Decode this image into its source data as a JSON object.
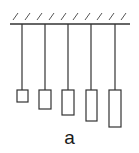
{
  "figure": {
    "label": "a",
    "ceiling": {
      "x1": 10,
      "x2": 130,
      "y": 24,
      "hatch_count": 10
    },
    "pendulums": [
      {
        "string_x": 22,
        "box_x": 17,
        "box_y": 90,
        "box_w": 11,
        "box_h": 12
      },
      {
        "string_x": 45,
        "box_x": 39,
        "box_y": 90,
        "box_w": 12,
        "box_h": 19
      },
      {
        "string_x": 68,
        "box_x": 62,
        "box_y": 90,
        "box_w": 12,
        "box_h": 25
      },
      {
        "string_x": 91,
        "box_x": 86,
        "box_y": 90,
        "box_w": 11,
        "box_h": 31
      },
      {
        "string_x": 115,
        "box_x": 109,
        "box_y": 90,
        "box_w": 12,
        "box_h": 37
      }
    ],
    "stroke_color": "#333333"
  }
}
